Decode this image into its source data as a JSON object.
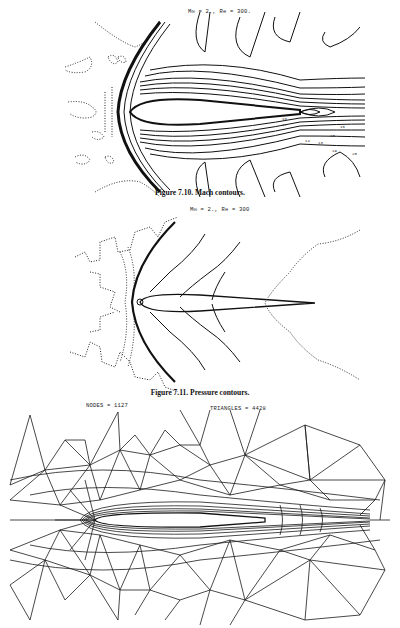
{
  "figures": [
    {
      "id": "7.10",
      "params": "M∞ = 2., Re = 300.",
      "caption": "Figure 7.10. Mach contours.",
      "contour_labels": [
        "18",
        "17",
        "16",
        "15",
        "14",
        "13",
        "19",
        "20"
      ]
    },
    {
      "id": "7.11",
      "params": "M∞ = 2., Re = 300",
      "caption": "Figure 7.11. Pressure contours."
    },
    {
      "id": "mesh",
      "nodes_label": "NODES = 1127",
      "triangles_label": "TRIANGLES = 4428"
    }
  ]
}
